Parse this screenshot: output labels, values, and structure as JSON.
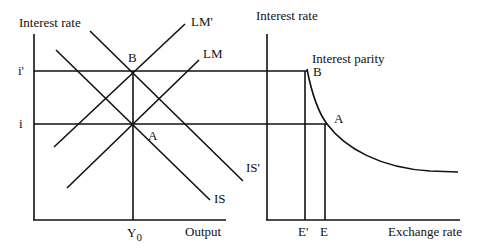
{
  "left_panel": {
    "y_axis_label": "Interest rate",
    "x_axis_label": "Output",
    "tick_i_prime": "i'",
    "tick_i": "i",
    "tick_y0_main": "Y",
    "tick_y0_sub": "0",
    "curves": {
      "lm_prime": "LM'",
      "lm": "LM",
      "is_prime": "IS'",
      "is": "IS"
    },
    "points": {
      "b": "B",
      "a": "A"
    }
  },
  "right_panel": {
    "y_axis_label": "Interest rate",
    "x_axis_label": "Exchange rate",
    "curve_label": "Interest parity",
    "tick_e_prime": "E'",
    "tick_e": "E",
    "points": {
      "b": "B",
      "a": "A"
    }
  }
}
